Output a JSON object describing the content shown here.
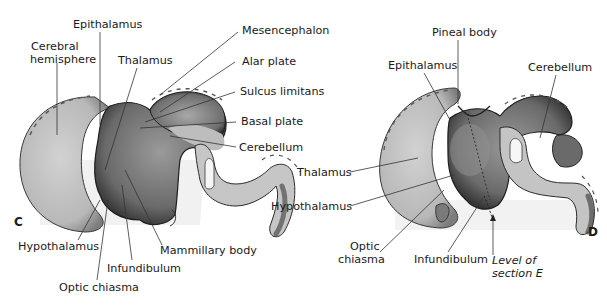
{
  "panels": [
    {
      "id": "C",
      "panel_letter": "C",
      "labels": {
        "epithalamus": "Epithalamus",
        "cerebral_hemisphere_l1": "Cerebral",
        "cerebral_hemisphere_l2": "hemisphere",
        "thalamus": "Thalamus",
        "mesencephalon": "Mesencephalon",
        "alar_plate": "Alar plate",
        "sulcus_limitans": "Sulcus limitans",
        "basal_plate": "Basal plate",
        "cerebellum": "Cerebellum",
        "hypothalamus": "Hypothalamus",
        "mammillary_body": "Mammillary body",
        "infundibulum": "Infundibulum",
        "optic_chiasma": "Optic chiasma"
      }
    },
    {
      "id": "D",
      "panel_letter": "D",
      "labels": {
        "pineal_body": "Pineal body",
        "epithalamus": "Epithalamus",
        "cerebellum": "Cerebellum",
        "thalamus": "Thalamus",
        "hypothalamus": "Hypothalamus",
        "optic_chiasma_l1": "Optic",
        "optic_chiasma_l2": "chiasma",
        "infundibulum": "Infundibulum",
        "level_l1": "Level of",
        "level_l2": "section E"
      }
    }
  ],
  "colors": {
    "tissue_light": "#c9c9c9",
    "tissue_mid": "#9a9a9a",
    "tissue_dark": "#4a4a4a",
    "outline": "#222222",
    "leader": "#333333"
  }
}
